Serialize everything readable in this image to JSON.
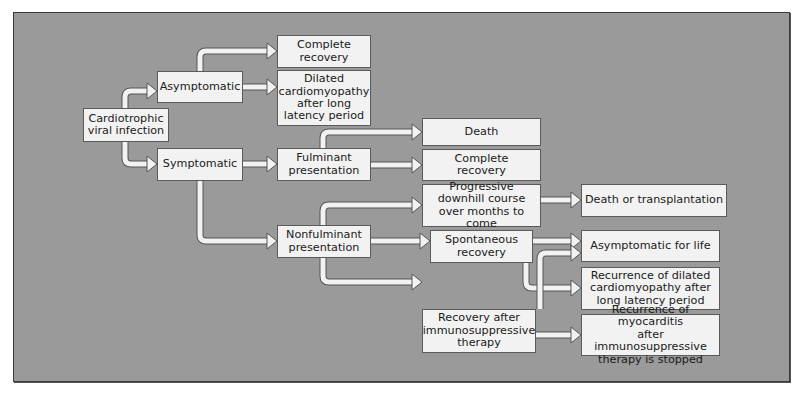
{
  "nodes": {
    "infection": "Cardiotrophic\nviral infection",
    "asymptomatic": "Asymptomatic",
    "symptomatic": "Symptomatic",
    "complete_recovery_1": "Complete\nrecovery",
    "dilated_cm": "Dilated\ncardiomyopathy\nafter long\nlatency period",
    "fulminant": "Fulminant\npresentation",
    "nonfulminant": "Nonfulminant\npresentation",
    "death": "Death",
    "complete_recovery_2": "Complete\nrecovery",
    "progressive": "Progressive\ndownhill course\nover months to come",
    "death_or_transplant": "Death or transplantation",
    "spontaneous": "Spontaneous\nrecovery",
    "asymptomatic_life": "Asymptomatic for life",
    "recurrence_dilated": "Recurrence of dilated\ncardiomyopathy after\nlong latency period",
    "recovery_immuno": "Recovery after\nimmunosuppressive\ntherapy",
    "recurrence_myocarditis": "Recurrence of myocarditis\nafter immunosuppressive\ntherapy is stopped"
  },
  "edges": [
    [
      "infection",
      "asymptomatic"
    ],
    [
      "infection",
      "symptomatic"
    ],
    [
      "asymptomatic",
      "complete_recovery_1"
    ],
    [
      "asymptomatic",
      "dilated_cm"
    ],
    [
      "symptomatic",
      "fulminant"
    ],
    [
      "symptomatic",
      "nonfulminant"
    ],
    [
      "fulminant",
      "death"
    ],
    [
      "fulminant",
      "complete_recovery_2"
    ],
    [
      "nonfulminant",
      "progressive"
    ],
    [
      "nonfulminant",
      "spontaneous"
    ],
    [
      "nonfulminant",
      "recovery_immuno"
    ],
    [
      "progressive",
      "death_or_transplant"
    ],
    [
      "spontaneous",
      "asymptomatic_life"
    ],
    [
      "spontaneous",
      "recurrence_dilated"
    ],
    [
      "recovery_immuno",
      "asymptomatic_life"
    ],
    [
      "recovery_immuno",
      "recurrence_myocarditis"
    ]
  ]
}
